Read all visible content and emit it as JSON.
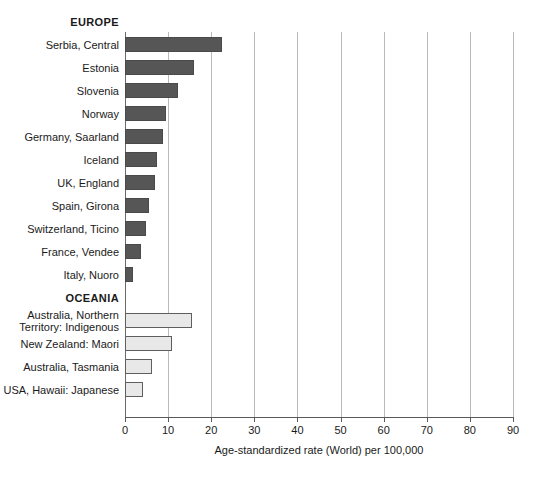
{
  "chart_data": {
    "type": "bar",
    "orientation": "horizontal",
    "title": "",
    "xlabel": "Age-standardized rate (World) per 100,000",
    "ylabel": "",
    "xlim": [
      0,
      90
    ],
    "xticks": [
      0,
      10,
      20,
      30,
      40,
      50,
      60,
      70,
      80,
      90
    ],
    "grid": true,
    "legend": "none",
    "groups": [
      {
        "name": "EUROPE",
        "color": "#565656",
        "categories": [
          "Serbia, Central",
          "Estonia",
          "Slovenia",
          "Norway",
          "Germany, Saarland",
          "Iceland",
          "UK, England",
          "Spain, Girona",
          "Switzerland, Ticino",
          "France, Vendee",
          "Italy, Nuoro"
        ],
        "values": [
          22.5,
          16.0,
          12.3,
          9.6,
          8.8,
          7.5,
          7.0,
          5.6,
          4.9,
          3.7,
          1.9
        ]
      },
      {
        "name": "OCEANIA",
        "color": "#e8e8e8",
        "categories": [
          "Australia, Northern\nTerritory: Indigenous",
          "New Zealand: Maori",
          "Australia, Tasmania",
          "USA, Hawaii: Japanese"
        ],
        "values": [
          15.5,
          11.0,
          6.3,
          4.1
        ]
      }
    ]
  },
  "rows": [
    {
      "label": "EUROPE",
      "type": "header"
    },
    {
      "label": "Serbia, Central",
      "value": 22.5,
      "group": "europe"
    },
    {
      "label": "Estonia",
      "value": 16.0,
      "group": "europe"
    },
    {
      "label": "Slovenia",
      "value": 12.3,
      "group": "europe"
    },
    {
      "label": "Norway",
      "value": 9.6,
      "group": "europe"
    },
    {
      "label": "Germany, Saarland",
      "value": 8.8,
      "group": "europe"
    },
    {
      "label": "Iceland",
      "value": 7.5,
      "group": "europe"
    },
    {
      "label": "UK, England",
      "value": 7.0,
      "group": "europe"
    },
    {
      "label": "Spain, Girona",
      "value": 5.6,
      "group": "europe"
    },
    {
      "label": "Switzerland, Ticino",
      "value": 4.9,
      "group": "europe"
    },
    {
      "label": "France, Vendee",
      "value": 3.7,
      "group": "europe"
    },
    {
      "label": "Italy, Nuoro",
      "value": 1.9,
      "group": "europe"
    },
    {
      "label": "OCEANIA",
      "type": "header"
    },
    {
      "label": "Australia, Northern\nTerritory: Indigenous",
      "value": 15.5,
      "group": "oceania"
    },
    {
      "label": "New Zealand: Maori",
      "value": 11.0,
      "group": "oceania"
    },
    {
      "label": "Australia, Tasmania",
      "value": 6.3,
      "group": "oceania"
    },
    {
      "label": "USA, Hawaii: Japanese",
      "value": 4.1,
      "group": "oceania"
    }
  ]
}
